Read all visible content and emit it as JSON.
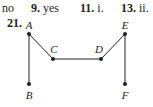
{
  "answers": [
    {
      "number": "",
      "text": "no"
    },
    {
      "number": "9.",
      "text": "yes"
    },
    {
      "number": "11.",
      "text": "i."
    },
    {
      "number": "13.",
      "text": "ii."
    }
  ],
  "problem": {
    "number": "21."
  },
  "graph": {
    "vertices": [
      {
        "id": "A",
        "label": "A",
        "x": 29,
        "y": 34,
        "lx": 29,
        "ly": 29
      },
      {
        "id": "B",
        "label": "B",
        "x": 29,
        "y": 84,
        "lx": 29,
        "ly": 99
      },
      {
        "id": "C",
        "label": "C",
        "x": 53,
        "y": 59,
        "lx": 54,
        "ly": 53
      },
      {
        "id": "D",
        "label": "D",
        "x": 101,
        "y": 59,
        "lx": 99,
        "ly": 53
      },
      {
        "id": "E",
        "label": "E",
        "x": 125,
        "y": 34,
        "lx": 125,
        "ly": 29
      },
      {
        "id": "F",
        "label": "F",
        "x": 125,
        "y": 84,
        "lx": 125,
        "ly": 99
      }
    ],
    "edges": [
      [
        "A",
        "B"
      ],
      [
        "A",
        "C"
      ],
      [
        "C",
        "D"
      ],
      [
        "D",
        "E"
      ],
      [
        "E",
        "F"
      ]
    ],
    "color": "#231f20"
  }
}
